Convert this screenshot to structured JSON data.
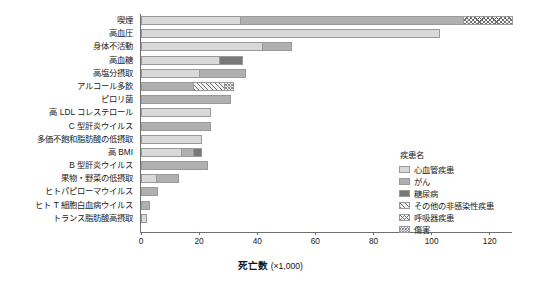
{
  "chart_data": {
    "type": "bar",
    "orientation": "horizontal",
    "stacked": true,
    "title": "",
    "xlabel": "死亡数 (×1,000)",
    "xlabel_main": "死亡数",
    "xlabel_unit": "(×1,000)",
    "ylabel": "",
    "xlim": [
      0,
      128
    ],
    "xticks": [
      0,
      20,
      40,
      60,
      80,
      100,
      120
    ],
    "xticklabels": [
      "0",
      "20",
      "40",
      "60",
      "80",
      "100",
      "120"
    ],
    "grid": false,
    "legend_position": "right",
    "legend_title": "疾患名",
    "categories": [
      "喫煙",
      "高血圧",
      "身体不活動",
      "高血糖",
      "高塩分摂取",
      "アルコール多飲",
      "ピロリ菌",
      "高 LDL コレステロール",
      "C 型肝炎ウイルス",
      "多価不飽和脂肪酸の低摂取",
      "高 BMI",
      "B 型肝炎ウイルス",
      "果物・野菜の低摂取",
      "ヒトパピローマウイルス",
      "ヒト T 細胞白血病ウイルス",
      "トランス脂肪酸高摂取"
    ],
    "series": [
      {
        "name": "心血管疾患",
        "key": "cvd",
        "color": "#d9d9d9",
        "pattern": "solid",
        "values": [
          34,
          103,
          42,
          27,
          20,
          0,
          0,
          24,
          0,
          21,
          14,
          0,
          5,
          0,
          0,
          2
        ]
      },
      {
        "name": "がん",
        "key": "cancer",
        "color": "#b0b0b0",
        "pattern": "solid",
        "values": [
          77,
          0,
          10,
          0,
          16,
          18,
          31,
          0,
          24,
          0,
          4,
          23,
          8,
          6,
          3,
          0
        ]
      },
      {
        "name": "糖尿病",
        "key": "diabetes",
        "color": "#787878",
        "pattern": "solid",
        "values": [
          0,
          0,
          0,
          8,
          0,
          0,
          0,
          0,
          0,
          0,
          3,
          0,
          0,
          0,
          0,
          0
        ]
      },
      {
        "name": "その他の非感染性疾患",
        "key": "other",
        "color": "#6e6e6e",
        "pattern": "diagonal-hatch",
        "values": [
          0,
          0,
          0,
          0,
          0,
          11,
          0,
          0,
          0,
          0,
          0,
          0,
          0,
          0,
          0,
          0
        ]
      },
      {
        "name": "呼吸器疾患",
        "key": "resp",
        "color": "#6e6e6e",
        "pattern": "cross-hatch",
        "values": [
          17,
          0,
          0,
          0,
          0,
          0,
          0,
          0,
          0,
          0,
          0,
          0,
          0,
          0,
          0,
          0
        ]
      },
      {
        "name": "傷害",
        "key": "injury",
        "color": "#8a8a8a",
        "pattern": "dense-cross-hatch",
        "values": [
          0,
          0,
          0,
          0,
          0,
          3,
          0,
          0,
          0,
          0,
          0,
          0,
          0,
          0,
          0,
          0
        ]
      }
    ],
    "totals": [
      128,
      103,
      52,
      35,
      36,
      32,
      31,
      24,
      24,
      21,
      21,
      23,
      13,
      6,
      3,
      2
    ]
  }
}
